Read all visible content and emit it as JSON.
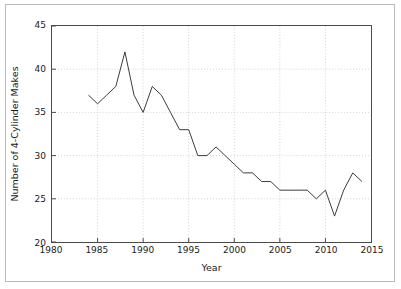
{
  "chart_data": {
    "type": "line",
    "title": "",
    "xlabel": "Year",
    "ylabel": "Number of 4-Cylinder Makes",
    "xlim": [
      1980,
      2015
    ],
    "ylim": [
      20,
      45
    ],
    "xticks": [
      1980,
      1985,
      1990,
      1995,
      2000,
      2005,
      2010,
      2015
    ],
    "xtick_labels": [
      "1980",
      "1985",
      "1990",
      "1995",
      "2000",
      "2005",
      "2010",
      "2015"
    ],
    "yticks": [
      20,
      25,
      30,
      35,
      40,
      45
    ],
    "ytick_labels": [
      "20",
      "25",
      "30",
      "35",
      "40",
      "45"
    ],
    "grid": true,
    "grid_style": "dotted",
    "grid_color": "#c8c8c8",
    "legend": false,
    "line_color": "#3c3c3c",
    "line_width": 1,
    "series": [
      {
        "name": "Number of 4-Cylinder Makes",
        "x": [
          1984,
          1985,
          1986,
          1987,
          1988,
          1989,
          1990,
          1991,
          1992,
          1993,
          1994,
          1995,
          1996,
          1997,
          1998,
          1999,
          2000,
          2001,
          2002,
          2003,
          2004,
          2005,
          2006,
          2007,
          2008,
          2009,
          2010,
          2011,
          2012,
          2013,
          2014
        ],
        "values": [
          37,
          36,
          37,
          38,
          42,
          37,
          35,
          38,
          37,
          35,
          33,
          33,
          30,
          30,
          31,
          30,
          29,
          28,
          28,
          27,
          27,
          26,
          26,
          26,
          26,
          25,
          26,
          23,
          26,
          28,
          27
        ]
      }
    ]
  }
}
